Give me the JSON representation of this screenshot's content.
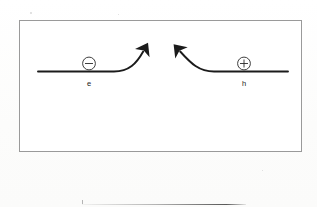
{
  "figure": {
    "name": "carrier-transport-band-diagram",
    "frame": {
      "border_color": "#9a9a9a",
      "background": "#ffffff"
    },
    "ink_color": "#1b1b1b",
    "electron": {
      "symbol": "−",
      "symbol_name": "minus-sign",
      "label": "e",
      "circle_cx": 89,
      "circle_cy": 63.5,
      "circle_r": 6.5,
      "label_x": 89,
      "label_y": 85
    },
    "hole": {
      "symbol": "+",
      "symbol_name": "plus-sign",
      "label": "h",
      "circle_cx": 244,
      "circle_cy": 63.5,
      "circle_r": 6.5,
      "label_x": 244,
      "label_y": 85
    },
    "left_band": {
      "name": "electron-band-with-upward-arrow",
      "path": "M 38 71.5 L 114 71.5 C 128 71.5 136 64 144.5 49.5",
      "arrow_tip_x": 145,
      "arrow_tip_y": 48,
      "arrow_direction": "up-right"
    },
    "right_band": {
      "name": "hole-band-with-upward-arrow",
      "path": "M 288 71.5 L 214 71.5 C 199 71.5 190 64 178.5 49.5",
      "arrow_tip_x": 178,
      "arrow_tip_y": 48,
      "arrow_direction": "up-left"
    },
    "footer_rule": {
      "name": "page-footer-rule",
      "visible": true
    }
  }
}
